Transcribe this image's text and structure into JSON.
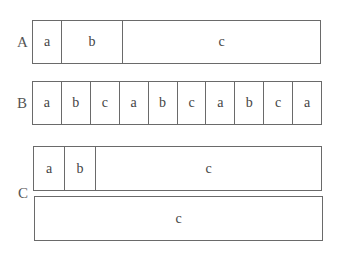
{
  "rows": {
    "A": {
      "label": "A",
      "cells": [
        "a",
        "b",
        "c"
      ]
    },
    "B": {
      "label": "B",
      "cells": [
        "a",
        "b",
        "c",
        "a",
        "b",
        "c",
        "a",
        "b",
        "c",
        "a"
      ]
    },
    "C": {
      "label": "C",
      "top_cells": [
        "a",
        "b",
        "c"
      ],
      "bottom_cells": [
        "c"
      ]
    }
  }
}
